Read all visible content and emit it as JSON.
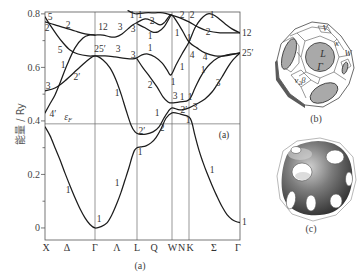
{
  "figure": {
    "panel_a_caption": "(a)",
    "panel_b_caption": "(b)",
    "panel_c_caption": "(c)"
  },
  "brillouin_zone": {
    "labels": {
      "v": "V",
      "kappa": "κ",
      "w": "W",
      "l": "L",
      "gamma": "Γ",
      "nu_beta": "ν₂β"
    }
  },
  "chart_data": {
    "type": "line",
    "title": "",
    "xlabel": "",
    "ylabel": "能量 / Ry",
    "xlim": [
      0,
      3.9
    ],
    "ylim": [
      -0.045,
      0.807
    ],
    "grid": false,
    "legend": null,
    "yticks": [
      {
        "value": 0,
        "label": "0"
      },
      {
        "value": 0.2,
        "label": "0.2"
      },
      {
        "value": 0.4,
        "label": "0.4"
      },
      {
        "value": 0.6,
        "label": "0.6"
      },
      {
        "value": 0.8,
        "label": "0.8"
      }
    ],
    "yminor": [
      0.1,
      0.3,
      0.5,
      0.7
    ],
    "xticks": [
      {
        "k": 0.02,
        "label": "X"
      },
      {
        "k": 0.44,
        "label": "Δ"
      },
      {
        "k": 1.0,
        "label": "Γ"
      },
      {
        "k": 1.44,
        "label": "Λ"
      },
      {
        "k": 1.84,
        "label": "L"
      },
      {
        "k": 2.18,
        "label": "Q"
      },
      {
        "k": 2.55,
        "label": "W"
      },
      {
        "k": 2.73,
        "label": "N"
      },
      {
        "k": 2.9,
        "label": "K"
      },
      {
        "k": 3.38,
        "label": "Σ"
      },
      {
        "k": 3.86,
        "label": "Γ"
      }
    ],
    "symmetry_lines": [
      1.0,
      1.84,
      2.54,
      2.88
    ],
    "fermi_level": {
      "E": 0.389,
      "symbol": "ε",
      "subscript": "F",
      "label_k": 0.46,
      "label_E": 0.415
    },
    "panel_label": {
      "text": "(a)",
      "k": 3.58,
      "E": 0.348
    },
    "bands": [
      {
        "name": "band-1",
        "points": [
          [
            0,
            0.378
          ],
          [
            0.1,
            0.345
          ],
          [
            0.2,
            0.3
          ],
          [
            0.3,
            0.255
          ],
          [
            0.4,
            0.205
          ],
          [
            0.5,
            0.158
          ],
          [
            0.6,
            0.113
          ],
          [
            0.7,
            0.072
          ],
          [
            0.8,
            0.038
          ],
          [
            0.9,
            0.013
          ],
          [
            1.0,
            0.0
          ],
          [
            1.12,
            0.005
          ],
          [
            1.24,
            0.019
          ],
          [
            1.34,
            0.05
          ],
          [
            1.44,
            0.093
          ],
          [
            1.52,
            0.133
          ],
          [
            1.6,
            0.179
          ],
          [
            1.68,
            0.226
          ],
          [
            1.74,
            0.265
          ],
          [
            1.79,
            0.29
          ],
          [
            1.84,
            0.3
          ],
          [
            1.92,
            0.303
          ],
          [
            2.02,
            0.307
          ],
          [
            2.12,
            0.318
          ],
          [
            2.22,
            0.338
          ],
          [
            2.32,
            0.37
          ],
          [
            2.42,
            0.41
          ],
          [
            2.54,
            0.43
          ],
          [
            2.7,
            0.426
          ],
          [
            2.88,
            0.415
          ],
          [
            2.94,
            0.392
          ],
          [
            3.0,
            0.345
          ],
          [
            3.08,
            0.29
          ],
          [
            3.16,
            0.245
          ],
          [
            3.24,
            0.205
          ],
          [
            3.34,
            0.16
          ],
          [
            3.44,
            0.118
          ],
          [
            3.54,
            0.08
          ],
          [
            3.64,
            0.05
          ],
          [
            3.74,
            0.032
          ],
          [
            3.82,
            0.024
          ],
          [
            3.9,
            0.02
          ]
        ]
      },
      {
        "name": "band-2",
        "points": [
          [
            0,
            0.512
          ],
          [
            0.2,
            0.523
          ],
          [
            0.4,
            0.55
          ],
          [
            0.64,
            0.591
          ],
          [
            0.86,
            0.628
          ],
          [
            1.0,
            0.643
          ],
          [
            1.16,
            0.628
          ],
          [
            1.3,
            0.598
          ],
          [
            1.42,
            0.553
          ],
          [
            1.52,
            0.501
          ],
          [
            1.62,
            0.441
          ],
          [
            1.72,
            0.385
          ],
          [
            1.8,
            0.359
          ],
          [
            1.88,
            0.351
          ],
          [
            2.02,
            0.351
          ],
          [
            2.16,
            0.359
          ],
          [
            2.28,
            0.378
          ],
          [
            2.38,
            0.411
          ],
          [
            2.46,
            0.434
          ],
          [
            2.54,
            0.449
          ],
          [
            2.7,
            0.441
          ],
          [
            2.88,
            0.449
          ],
          [
            3.04,
            0.464
          ],
          [
            3.2,
            0.482
          ],
          [
            3.34,
            0.508
          ],
          [
            3.44,
            0.535
          ],
          [
            3.54,
            0.564
          ],
          [
            3.66,
            0.602
          ],
          [
            3.76,
            0.628
          ],
          [
            3.9,
            0.654
          ]
        ]
      },
      {
        "name": "band-3",
        "points": [
          [
            0,
            0.43
          ],
          [
            0.1,
            0.464
          ],
          [
            0.2,
            0.497
          ],
          [
            0.3,
            0.542
          ],
          [
            0.44,
            0.609
          ],
          [
            0.6,
            0.673
          ],
          [
            0.76,
            0.71
          ],
          [
            0.9,
            0.721
          ],
          [
            1.0,
            0.721
          ],
          [
            1.16,
            0.721
          ],
          [
            1.3,
            0.714
          ],
          [
            1.42,
            0.714
          ],
          [
            1.54,
            0.725
          ],
          [
            1.66,
            0.744
          ],
          [
            1.76,
            0.759
          ],
          [
            1.84,
            0.768
          ],
          [
            2.0,
            0.781
          ],
          [
            2.14,
            0.774
          ],
          [
            2.3,
            0.759
          ],
          [
            2.4,
            0.77
          ],
          [
            2.52,
            0.796
          ],
          [
            2.64,
            0.77
          ],
          [
            2.76,
            0.733
          ],
          [
            2.88,
            0.695
          ],
          [
            3.04,
            0.673
          ],
          [
            3.2,
            0.654
          ],
          [
            3.4,
            0.643
          ],
          [
            3.6,
            0.643
          ],
          [
            3.9,
            0.654
          ]
        ]
      },
      {
        "name": "band-4",
        "points": [
          [
            0,
            0.77
          ],
          [
            0.2,
            0.759
          ],
          [
            0.4,
            0.748
          ],
          [
            0.6,
            0.736
          ],
          [
            0.8,
            0.725
          ],
          [
            1.0,
            0.721
          ]
        ]
      },
      {
        "name": "band-5",
        "points": [
          [
            0,
            0.789
          ],
          [
            0.1,
            0.759
          ],
          [
            0.24,
            0.721
          ],
          [
            0.36,
            0.692
          ],
          [
            0.5,
            0.665
          ],
          [
            0.66,
            0.65
          ],
          [
            0.86,
            0.643
          ],
          [
            1.0,
            0.643
          ],
          [
            1.2,
            0.643
          ],
          [
            1.4,
            0.639
          ],
          [
            1.6,
            0.634
          ],
          [
            1.76,
            0.632
          ],
          [
            1.84,
            0.636
          ],
          [
            1.94,
            0.647
          ],
          [
            2.06,
            0.65
          ],
          [
            2.2,
            0.639
          ],
          [
            2.34,
            0.617
          ],
          [
            2.44,
            0.591
          ],
          [
            2.52,
            0.572
          ],
          [
            2.62,
            0.609
          ],
          [
            2.74,
            0.65
          ],
          [
            2.88,
            0.695
          ],
          [
            3.0,
            0.748
          ],
          [
            3.12,
            0.781
          ],
          [
            3.26,
            0.8
          ],
          [
            3.4,
            0.793
          ],
          [
            3.6,
            0.763
          ],
          [
            3.74,
            0.744
          ],
          [
            3.9,
            0.729
          ]
        ]
      },
      {
        "name": "band-6",
        "points": [
          [
            1.84,
            0.632
          ],
          [
            1.96,
            0.598
          ],
          [
            2.1,
            0.564
          ],
          [
            2.24,
            0.527
          ],
          [
            2.36,
            0.49
          ],
          [
            2.46,
            0.471
          ],
          [
            2.54,
            0.467
          ],
          [
            2.7,
            0.471
          ],
          [
            2.88,
            0.479
          ],
          [
            3.0,
            0.523
          ],
          [
            3.1,
            0.561
          ],
          [
            3.2,
            0.591
          ],
          [
            3.3,
            0.613
          ],
          [
            3.46,
            0.636
          ],
          [
            3.64,
            0.647
          ],
          [
            3.9,
            0.654
          ]
        ]
      },
      {
        "name": "band-7",
        "points": [
          [
            1.66,
            0.812
          ],
          [
            1.76,
            0.803
          ],
          [
            1.84,
            0.8
          ],
          [
            2.0,
            0.804
          ],
          [
            2.2,
            0.804
          ],
          [
            2.36,
            0.804
          ],
          [
            2.52,
            0.796
          ],
          [
            2.7,
            0.785
          ],
          [
            2.88,
            0.77
          ],
          [
            3.06,
            0.751
          ],
          [
            3.26,
            0.736
          ],
          [
            3.5,
            0.729
          ],
          [
            3.7,
            0.729
          ],
          [
            3.9,
            0.729
          ]
        ]
      },
      {
        "name": "band-8",
        "points": [
          [
            1.84,
            0.763
          ],
          [
            2.0,
            0.748
          ],
          [
            2.14,
            0.733
          ],
          [
            2.26,
            0.733
          ],
          [
            2.38,
            0.751
          ],
          [
            2.52,
            0.796
          ]
        ]
      }
    ],
    "annotations": [
      {
        "text": "5",
        "k": 0.1,
        "E": 0.789
      },
      {
        "text": "2",
        "k": 0.04,
        "E": 0.748
      },
      {
        "text": "2",
        "k": 0.46,
        "E": 0.759
      },
      {
        "text": "5",
        "k": 0.3,
        "E": 0.665
      },
      {
        "text": "1",
        "k": 0.36,
        "E": 0.609
      },
      {
        "text": "2′",
        "k": 0.64,
        "E": 0.564
      },
      {
        "text": "3",
        "k": 0.06,
        "E": 0.531
      },
      {
        "text": "4′",
        "k": 0.16,
        "E": 0.426
      },
      {
        "text": "1",
        "k": 0.46,
        "E": 0.142
      },
      {
        "text": "1",
        "k": 1.08,
        "E": 0.034
      },
      {
        "text": "1",
        "k": 1.44,
        "E": 0.168
      },
      {
        "text": "12",
        "k": 1.16,
        "E": 0.751
      },
      {
        "text": "3",
        "k": 1.5,
        "E": 0.751
      },
      {
        "text": "25′",
        "k": 1.1,
        "E": 0.669
      },
      {
        "text": "3",
        "k": 1.46,
        "E": 0.669
      },
      {
        "text": "1",
        "k": 1.44,
        "E": 0.505
      },
      {
        "text": "1",
        "k": 1.74,
        "E": 0.796
      },
      {
        "text": "1",
        "k": 1.9,
        "E": 0.796
      },
      {
        "text": "3",
        "k": 1.76,
        "E": 0.744
      },
      {
        "text": "3",
        "k": 1.76,
        "E": 0.647
      },
      {
        "text": "2",
        "k": 2.14,
        "E": 0.774
      },
      {
        "text": "1",
        "k": 2.1,
        "E": 0.718
      },
      {
        "text": "1",
        "k": 2.1,
        "E": 0.673
      },
      {
        "text": "2",
        "k": 2.1,
        "E": 0.535
      },
      {
        "text": "2",
        "k": 2.74,
        "E": 0.796
      },
      {
        "text": "2",
        "k": 2.94,
        "E": 0.796
      },
      {
        "text": "1",
        "k": 2.64,
        "E": 0.729
      },
      {
        "text": "1",
        "k": 2.88,
        "E": 0.71
      },
      {
        "text": "4",
        "k": 2.94,
        "E": 0.647
      },
      {
        "text": "1",
        "k": 2.74,
        "E": 0.602
      },
      {
        "text": "1",
        "k": 2.56,
        "E": 0.546
      },
      {
        "text": "1",
        "k": 3.34,
        "E": 0.796
      },
      {
        "text": "2",
        "k": 3.26,
        "E": 0.733
      },
      {
        "text": "4",
        "k": 3.2,
        "E": 0.639
      },
      {
        "text": "1",
        "k": 3.16,
        "E": 0.591
      },
      {
        "text": "3",
        "k": 3.46,
        "E": 0.542
      },
      {
        "text": "3",
        "k": 2.6,
        "E": 0.493
      },
      {
        "text": "1",
        "k": 2.74,
        "E": 0.49
      },
      {
        "text": "1",
        "k": 2.9,
        "E": 0.49
      },
      {
        "text": "2′",
        "k": 2.78,
        "E": 0.441
      },
      {
        "text": "3",
        "k": 3.0,
        "E": 0.452
      },
      {
        "text": "1",
        "k": 2.86,
        "E": 0.404
      },
      {
        "text": "1",
        "k": 2.24,
        "E": 0.43
      },
      {
        "text": "2",
        "k": 2.34,
        "E": 0.374
      },
      {
        "text": "2′",
        "k": 1.94,
        "E": 0.363
      },
      {
        "text": "1",
        "k": 1.9,
        "E": 0.284
      },
      {
        "text": "1",
        "k": 3.34,
        "E": 0.217
      },
      {
        "text": "12",
        "k": 3.94,
        "E": 0.729,
        "anchor": "start"
      },
      {
        "text": "25′",
        "k": 3.94,
        "E": 0.654,
        "anchor": "start"
      },
      {
        "text": "1",
        "k": 3.94,
        "E": 0.022,
        "anchor": "start"
      }
    ]
  }
}
